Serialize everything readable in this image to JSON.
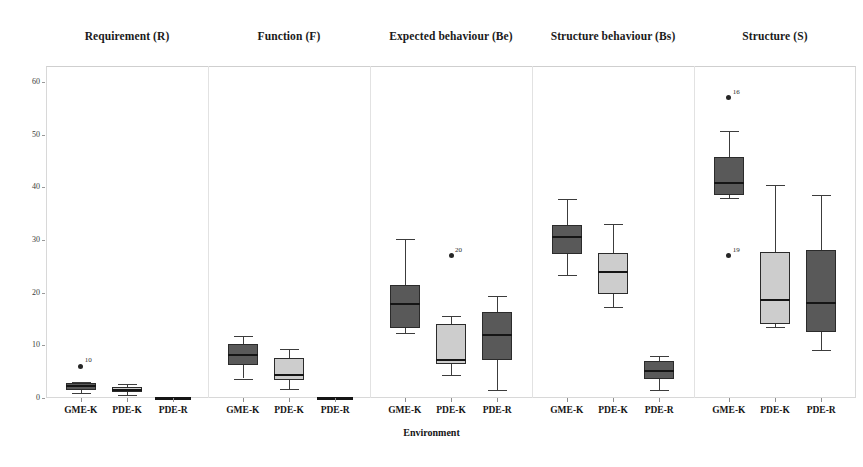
{
  "figure": {
    "xlabel": "Environment",
    "ylabel": "",
    "panel_titles": [
      "Requirement (R)",
      "Function (F)",
      "Expected behaviour (Be)",
      "Structure behaviour (Bs)",
      "Structure (S)"
    ],
    "y_ticks": [
      "0",
      "10",
      "20",
      "30",
      "40",
      "50",
      "60"
    ],
    "x_ticks": [
      "GME-K",
      "PDE-K",
      "PDE-R"
    ],
    "colors": {
      "box_dark": "#595959",
      "box_light": "#cdcdcd",
      "outline": "#2b2b2b",
      "median": "#151515",
      "whisker": "#3c3c3c",
      "frame": "#d8d8d8",
      "outlier": "#262626"
    }
  },
  "chart_data": {
    "type": "box",
    "title": "",
    "xlabel": "Environment",
    "ylabel": "",
    "ylim": [
      0,
      63
    ],
    "grid": false,
    "legend": "none",
    "categories": [
      "GME-K",
      "PDE-K",
      "PDE-R"
    ],
    "panels": [
      {
        "name": "Requirement (R)",
        "boxes": [
          {
            "group": "GME-K",
            "fill": "dark",
            "whisker_low": 1.0,
            "q1": 1.6,
            "median": 2.2,
            "q3": 2.9,
            "whisker_high": 3.1,
            "outliers": []
          },
          {
            "group": "PDE-K",
            "fill": "light",
            "whisker_low": 0.6,
            "q1": 1.2,
            "median": 1.6,
            "q3": 2.1,
            "whisker_high": 2.6,
            "outliers": []
          },
          {
            "group": "PDE-R",
            "fill": "dark",
            "whisker_low": 0.0,
            "q1": 0.0,
            "median": 0.0,
            "q3": 0.0,
            "whisker_high": 0.0,
            "outliers": []
          }
        ],
        "outlier_points": [
          {
            "group": "GME-K",
            "value": 6.0,
            "label": "10"
          }
        ]
      },
      {
        "name": "Function (F)",
        "boxes": [
          {
            "group": "GME-K",
            "fill": "dark",
            "whisker_low": 3.7,
            "q1": 6.2,
            "median": 8.2,
            "q3": 10.3,
            "whisker_high": 11.7,
            "outliers": []
          },
          {
            "group": "PDE-K",
            "fill": "light",
            "whisker_low": 1.8,
            "q1": 3.5,
            "median": 4.3,
            "q3": 7.6,
            "whisker_high": 9.3,
            "outliers": []
          },
          {
            "group": "PDE-R",
            "fill": "dark",
            "whisker_low": 0.0,
            "q1": 0.0,
            "median": 0.0,
            "q3": 0.0,
            "whisker_high": 0.0,
            "outliers": []
          }
        ],
        "outlier_points": []
      },
      {
        "name": "Expected behaviour (Be)",
        "boxes": [
          {
            "group": "GME-K",
            "fill": "dark",
            "whisker_low": 12.4,
            "q1": 13.2,
            "median": 17.8,
            "q3": 21.4,
            "whisker_high": 30.1,
            "outliers": []
          },
          {
            "group": "PDE-K",
            "fill": "light",
            "whisker_low": 4.3,
            "q1": 6.4,
            "median": 7.2,
            "q3": 14.0,
            "whisker_high": 15.5,
            "outliers": []
          },
          {
            "group": "PDE-R",
            "fill": "dark",
            "whisker_low": 1.6,
            "q1": 7.2,
            "median": 12.0,
            "q3": 16.4,
            "whisker_high": 19.4,
            "outliers": []
          }
        ],
        "outlier_points": [
          {
            "group": "PDE-K",
            "value": 27.0,
            "label": "20"
          }
        ]
      },
      {
        "name": "Structure behaviour (Bs)",
        "boxes": [
          {
            "group": "GME-K",
            "fill": "dark",
            "whisker_low": 23.3,
            "q1": 27.3,
            "median": 30.6,
            "q3": 32.8,
            "whisker_high": 37.7,
            "outliers": []
          },
          {
            "group": "PDE-K",
            "fill": "light",
            "whisker_low": 17.3,
            "q1": 19.7,
            "median": 23.9,
            "q3": 27.6,
            "whisker_high": 33.0,
            "outliers": []
          },
          {
            "group": "PDE-R",
            "fill": "dark",
            "whisker_low": 1.6,
            "q1": 3.6,
            "median": 5.1,
            "q3": 7.0,
            "whisker_high": 7.9,
            "outliers": []
          }
        ],
        "outlier_points": []
      },
      {
        "name": "Structure (S)",
        "boxes": [
          {
            "group": "GME-K",
            "fill": "dark",
            "whisker_low": 38.0,
            "q1": 38.6,
            "median": 40.8,
            "q3": 45.7,
            "whisker_high": 50.6,
            "outliers": []
          },
          {
            "group": "PDE-K",
            "fill": "light",
            "whisker_low": 13.4,
            "q1": 14.0,
            "median": 18.6,
            "q3": 27.7,
            "whisker_high": 40.5,
            "outliers": []
          },
          {
            "group": "PDE-R",
            "fill": "dark",
            "whisker_low": 9.2,
            "q1": 12.6,
            "median": 18.0,
            "q3": 28.1,
            "whisker_high": 38.6,
            "outliers": []
          }
        ],
        "outlier_points": [
          {
            "group": "GME-K",
            "value": 57.0,
            "label": "16"
          },
          {
            "group": "GME-K",
            "value": 27.0,
            "label": "19"
          }
        ]
      }
    ]
  }
}
